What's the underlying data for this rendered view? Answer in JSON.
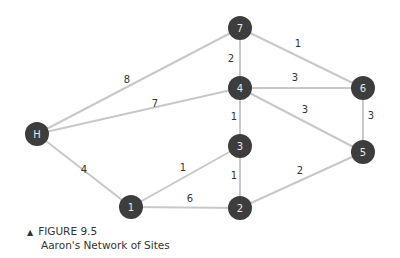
{
  "figure": {
    "marker": "▲",
    "number": "FIGURE 9.5",
    "title": "Aaron's Network of Sites"
  },
  "nodes": [
    {
      "id": "H",
      "label": "H",
      "x": 37,
      "y": 134
    },
    {
      "id": "1",
      "label": "1",
      "x": 131,
      "y": 207
    },
    {
      "id": "2",
      "label": "2",
      "x": 240,
      "y": 208
    },
    {
      "id": "3",
      "label": "3",
      "x": 240,
      "y": 146
    },
    {
      "id": "4",
      "label": "4",
      "x": 240,
      "y": 88
    },
    {
      "id": "5",
      "label": "5",
      "x": 363,
      "y": 152
    },
    {
      "id": "6",
      "label": "6",
      "x": 363,
      "y": 88
    },
    {
      "id": "7",
      "label": "7",
      "x": 240,
      "y": 28
    }
  ],
  "edges": [
    {
      "from": "H",
      "to": "7",
      "weight": "8",
      "lx": 127,
      "ly": 79
    },
    {
      "from": "H",
      "to": "4",
      "weight": "7",
      "lx": 155,
      "ly": 103
    },
    {
      "from": "H",
      "to": "1",
      "weight": "4",
      "lx": 84,
      "ly": 169
    },
    {
      "from": "1",
      "to": "3",
      "weight": "1",
      "lx": 183,
      "ly": 167
    },
    {
      "from": "1",
      "to": "2",
      "weight": "6",
      "lx": 190,
      "ly": 198
    },
    {
      "from": "3",
      "to": "2",
      "weight": "1",
      "lx": 234,
      "ly": 175
    },
    {
      "from": "4",
      "to": "3",
      "weight": "1",
      "lx": 234,
      "ly": 116
    },
    {
      "from": "7",
      "to": "4",
      "weight": "2",
      "lx": 231,
      "ly": 58
    },
    {
      "from": "7",
      "to": "6",
      "weight": "1",
      "lx": 298,
      "ly": 43
    },
    {
      "from": "4",
      "to": "6",
      "weight": "3",
      "lx": 295,
      "ly": 77
    },
    {
      "from": "4",
      "to": "5",
      "weight": "3",
      "lx": 305,
      "ly": 109
    },
    {
      "from": "6",
      "to": "5",
      "weight": "3",
      "lx": 371,
      "ly": 115
    },
    {
      "from": "2",
      "to": "5",
      "weight": "2",
      "lx": 300,
      "ly": 170
    }
  ]
}
